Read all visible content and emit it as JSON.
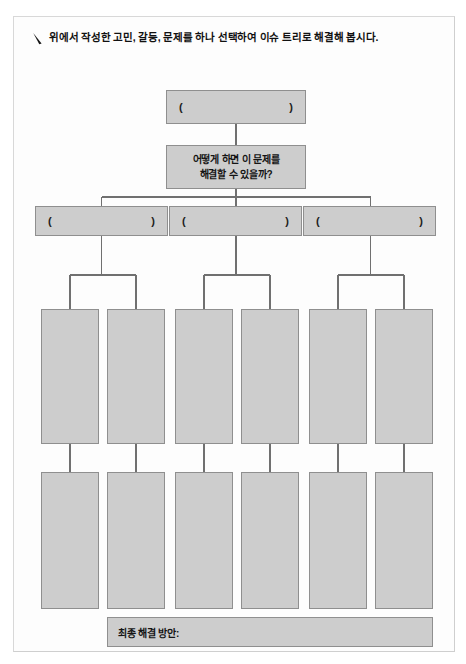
{
  "page": {
    "background_color": "#ffffff",
    "sheet_color": "#fdfdfd",
    "sheet_border_color": "#d8d8d8"
  },
  "header": {
    "bullet_icon": "pen-icon",
    "instruction": "위에서 작성한 고민, 갈등, 문제를 하나 선택하여 이슈 트리로 해결해 봅시다."
  },
  "diagram": {
    "type": "issue-tree",
    "node_fill_color": "#cdcdcd",
    "node_border_color": "#8f8f8f",
    "connector_color": "#707070",
    "root": {
      "open_paren": "(",
      "close_paren": ")",
      "value": ""
    },
    "question": {
      "text": "어떻게 하면 이 문제를\n해결할 수 있을까?"
    },
    "branches": [
      {
        "open_paren": "(",
        "close_paren": ")",
        "value": ""
      },
      {
        "open_paren": "(",
        "close_paren": ")",
        "value": ""
      },
      {
        "open_paren": "(",
        "close_paren": ")",
        "value": ""
      }
    ],
    "leaf_rows": [
      {
        "row_label": "leaf-row-1",
        "cells": [
          "",
          "",
          "",
          "",
          "",
          ""
        ]
      },
      {
        "row_label": "leaf-row-2",
        "cells": [
          "",
          "",
          "",
          "",
          "",
          ""
        ]
      }
    ]
  },
  "footer": {
    "final_solution_label": "최종 해결 방안:",
    "final_solution_value": ""
  }
}
